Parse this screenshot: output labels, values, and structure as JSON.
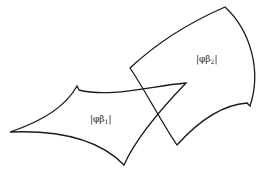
{
  "diagram": {
    "regions": [
      {
        "id": "region-1",
        "label": "|φβ",
        "subscript": "1",
        "suffix": "|"
      },
      {
        "id": "region-2",
        "label": "|φβ",
        "subscript": "2",
        "suffix": "|"
      }
    ],
    "stroke_color": "#1a1a1a",
    "background_color": "#ffffff"
  }
}
